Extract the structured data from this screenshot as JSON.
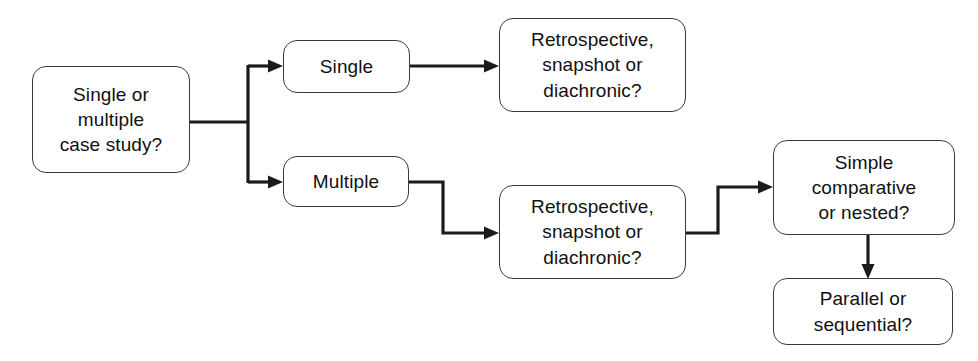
{
  "diagram": {
    "canvas": {
      "width": 978,
      "height": 361,
      "background": "#ffffff"
    },
    "stroke_color": "#1b1b1b",
    "node_border_color": "#3a3a3a",
    "node_fill": "#ffffff",
    "text_color": "#111111"
  },
  "nodes": [
    {
      "id": "case-study-question",
      "label": "Single or\nmultiple\ncase study?",
      "x": 32,
      "y": 66,
      "w": 158,
      "h": 107
    },
    {
      "id": "single",
      "label": "Single",
      "x": 283,
      "y": 40,
      "w": 127,
      "h": 53
    },
    {
      "id": "multiple",
      "label": "Multiple",
      "x": 283,
      "y": 156,
      "w": 126,
      "h": 51
    },
    {
      "id": "time-question-single",
      "label": "Retrospective,\nsnapshot or\ndiachronic?",
      "x": 499,
      "y": 18,
      "w": 187,
      "h": 94
    },
    {
      "id": "time-question-multiple",
      "label": "Retrospective,\nsnapshot or\ndiachronic?",
      "x": 499,
      "y": 185,
      "w": 187,
      "h": 94
    },
    {
      "id": "comparative-question",
      "label": "Simple\ncomparative\nor nested?",
      "x": 773,
      "y": 140,
      "w": 182,
      "h": 95
    },
    {
      "id": "parallel-question",
      "label": "Parallel or\nsequential?",
      "x": 773,
      "y": 278,
      "w": 180,
      "h": 67
    }
  ],
  "connectors": [
    {
      "id": "stem-from-case-study",
      "from": "case-study-question",
      "to": "branch-point",
      "kind": "line",
      "arrow": false
    },
    {
      "id": "branch-vertical",
      "from": "branch-point",
      "to": "branch-point",
      "kind": "line",
      "arrow": false
    },
    {
      "id": "branch-to-single",
      "from": "branch-point",
      "to": "single",
      "kind": "elbow",
      "arrow": true
    },
    {
      "id": "branch-to-multiple",
      "from": "branch-point",
      "to": "multiple",
      "kind": "elbow",
      "arrow": true
    },
    {
      "id": "single-to-time",
      "from": "single",
      "to": "time-question-single",
      "kind": "line",
      "arrow": true
    },
    {
      "id": "multiple-to-time",
      "from": "multiple",
      "to": "time-question-multiple",
      "kind": "step-down",
      "arrow": true
    },
    {
      "id": "time-to-comparative",
      "from": "time-question-multiple",
      "to": "comparative-question",
      "kind": "step-up",
      "arrow": true
    },
    {
      "id": "comparative-to-parallel",
      "from": "comparative-question",
      "to": "parallel-question",
      "kind": "line",
      "arrow": true
    }
  ]
}
